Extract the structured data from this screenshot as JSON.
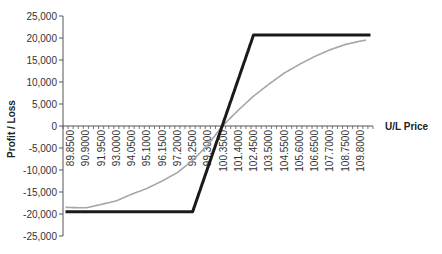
{
  "chart_data": {
    "type": "line",
    "title": "",
    "xlabel": "U/L Price",
    "ylabel": "Profit / Loss",
    "ylim": [
      -25000,
      25000
    ],
    "y_ticks": [
      25000,
      20000,
      15000,
      10000,
      5000,
      0,
      -5000,
      -10000,
      -15000,
      -20000,
      -25000
    ],
    "y_tick_labels": [
      "25,000",
      "20,000",
      "15,000",
      "10,000",
      "5,000",
      "0",
      "-5,000",
      "-10,000",
      "-15,000",
      "-20,000",
      "-25,000"
    ],
    "x_start": 89.5,
    "x_step": 0.35,
    "x_count": 61,
    "x_tick_labels": [
      "89.8500",
      "90.9000",
      "91.9500",
      "93.0000",
      "94.0500",
      "95.1000",
      "96.1500",
      "97.2000",
      "98.2500",
      "99.3000",
      "100.3500",
      "101.4000",
      "102.4500",
      "103.5000",
      "104.5500",
      "105.6000",
      "106.6500",
      "107.7000",
      "108.7500",
      "109.8000"
    ],
    "grid": false,
    "legend": "none",
    "series": [
      {
        "name": "Payoff at expiry",
        "color": "#1a1a1a",
        "breakpoints": [
          [
            89.5,
            -19500
          ],
          [
            98.25,
            -19500
          ],
          [
            102.45,
            20700
          ],
          [
            110.5,
            20700
          ]
        ]
      },
      {
        "name": "Current value",
        "color": "#a6a6a6",
        "breakpoints": [
          [
            89.5,
            -18500
          ],
          [
            90.9,
            -18600
          ],
          [
            92.0,
            -17800
          ],
          [
            93.0,
            -17000
          ],
          [
            94.05,
            -15500
          ],
          [
            95.1,
            -14200
          ],
          [
            96.15,
            -12500
          ],
          [
            97.2,
            -10600
          ],
          [
            98.25,
            -7800
          ],
          [
            99.3,
            -4300
          ],
          [
            100.3,
            0
          ],
          [
            101.4,
            3600
          ],
          [
            102.45,
            6800
          ],
          [
            103.5,
            9500
          ],
          [
            104.55,
            12000
          ],
          [
            105.6,
            14000
          ],
          [
            106.65,
            15800
          ],
          [
            107.7,
            17300
          ],
          [
            108.75,
            18500
          ],
          [
            109.8,
            19300
          ],
          [
            110.2,
            19500
          ]
        ]
      }
    ]
  }
}
